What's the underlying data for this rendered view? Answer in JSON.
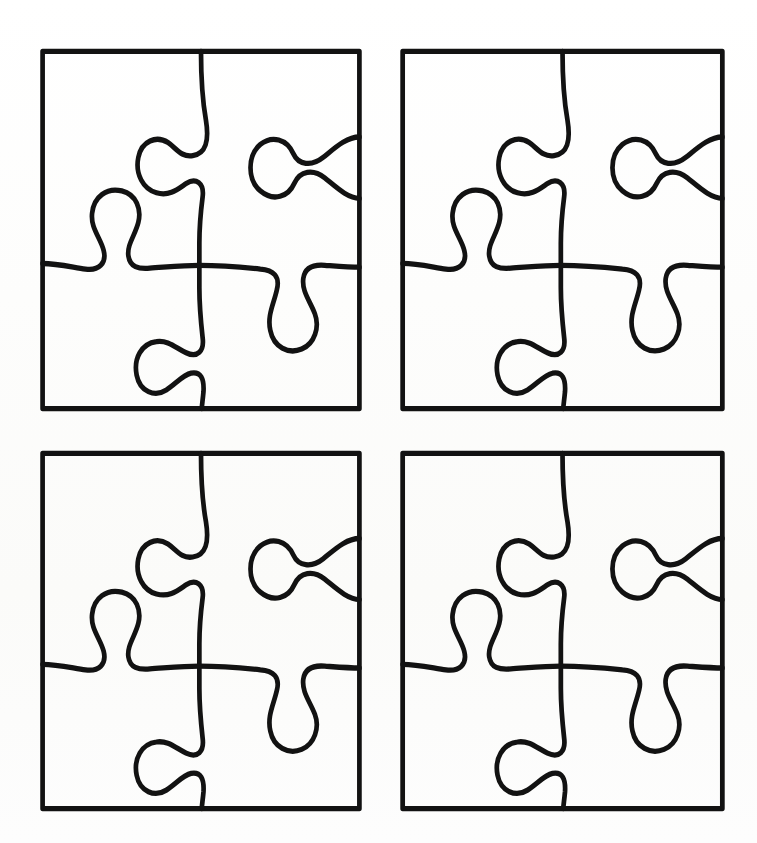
{
  "document": {
    "title": "Jigsaw Puzzle Template Sheet",
    "kind": "line-art-template",
    "page_width": 757,
    "page_height": 843,
    "background_color": "#fdfdfc",
    "ink_color": "#121212",
    "stroke_width": 5,
    "description": "Four identical four-piece jigsaw puzzle outlines arranged in a two-by-two grid on a blank page."
  },
  "grid": {
    "columns": 2,
    "rows": 2,
    "count": 4,
    "cells": [
      {
        "id": "puzzle-top-left",
        "label": "Puzzle 1",
        "position": "top-left",
        "x": 36,
        "y": 44,
        "width": 330,
        "height": 372,
        "pieces": 4
      },
      {
        "id": "puzzle-top-right",
        "label": "Puzzle 2",
        "position": "top-right",
        "x": 396,
        "y": 44,
        "width": 333,
        "height": 372,
        "pieces": 4
      },
      {
        "id": "puzzle-bottom-left",
        "label": "Puzzle 3",
        "position": "bottom-left",
        "x": 36,
        "y": 446,
        "width": 330,
        "height": 370,
        "pieces": 4
      },
      {
        "id": "puzzle-bottom-right",
        "label": "Puzzle 4",
        "position": "bottom-right",
        "x": 396,
        "y": 446,
        "width": 333,
        "height": 370,
        "pieces": 4
      }
    ]
  },
  "puzzle_shape": {
    "viewbox": "0 0 400 400",
    "border_path": "M 8 8 L 392 8 L 392 392 L 8 392 Z",
    "pieces": [
      {
        "name": "piece-top-left",
        "row": 0,
        "col": 0
      },
      {
        "name": "piece-top-right",
        "row": 0,
        "col": 1
      },
      {
        "name": "piece-bottom-left",
        "row": 1,
        "col": 0
      },
      {
        "name": "piece-bottom-right",
        "row": 1,
        "col": 1
      }
    ],
    "vertical_divider_path": "M 200 8 C 200 40 202 62 206 82 C 210 104 206 118 190 120 C 176 122 170 112 160 106 C 146 98 128 104 124 122 C 120 140 130 156 146 160 C 162 164 172 156 182 150 C 194 143 204 150 202 164 C 200 178 198 196 198 214 C 198 234 198 250 198 262 C 198 282 200 300 202 316 C 204 330 196 338 182 332 C 170 327 160 318 146 320 C 128 322 118 338 122 356 C 126 374 144 380 158 372 C 170 365 178 356 188 354 C 200 352 204 360 203 374 C 202 384 201 388 201 392",
    "horizontal_divider_path": "M 8 236 C 26 236 44 240 60 242 C 76 244 86 236 82 222 C 78 208 66 198 68 182 C 70 164 86 154 104 158 C 122 162 128 178 124 192 C 120 206 110 216 112 228 C 114 240 124 242 138 241 C 156 240 178 238 198 238 C 222 238 250 240 272 242 C 288 243 296 250 292 264 C 288 280 280 292 284 308 C 288 326 306 334 322 328 C 338 322 344 304 338 290 C 332 276 322 266 324 252 C 326 240 336 237 350 238 C 366 239 380 240 392 240",
    "knobs": [
      {
        "name": "knob-upper-left-outward",
        "location": "vertical divider, upper section",
        "direction": "left"
      },
      {
        "name": "knob-left-edge-inward",
        "location": "horizontal divider, left section",
        "direction": "up"
      },
      {
        "name": "knob-center-right-downward",
        "location": "horizontal divider, right section",
        "direction": "down"
      },
      {
        "name": "knob-lower-left-outward",
        "location": "vertical divider, lower section",
        "direction": "left"
      },
      {
        "name": "knob-right-edge-inward",
        "location": "right edge, upper section",
        "direction": "inward"
      }
    ],
    "right_edge_notch_path": "M 392 100 C 376 100 362 112 348 122 C 334 132 318 130 312 118 C 304 102 286 98 272 108 C 256 120 256 146 272 158 C 288 170 306 164 313 150 C 320 136 336 134 350 144 C 364 154 378 166 392 166"
  }
}
